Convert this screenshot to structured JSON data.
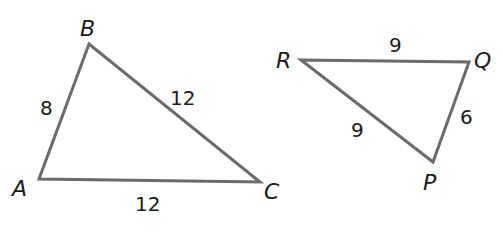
{
  "triangles": [
    {
      "name": "ABC",
      "vertices": {
        "A": {
          "label": "A",
          "x": 39,
          "y": 179,
          "lx": 12,
          "ly": 196
        },
        "B": {
          "label": "B",
          "x": 89,
          "y": 44,
          "lx": 80,
          "ly": 36
        },
        "C": {
          "label": "C",
          "x": 260,
          "y": 182,
          "lx": 264,
          "ly": 199
        }
      },
      "sides": {
        "AB": {
          "label": "8",
          "lx": 40,
          "ly": 115
        },
        "BC": {
          "label": "12",
          "lx": 170,
          "ly": 105
        },
        "AC": {
          "label": "12",
          "lx": 135,
          "ly": 211
        }
      }
    },
    {
      "name": "RQP",
      "vertices": {
        "R": {
          "label": "R",
          "x": 301,
          "y": 60,
          "lx": 276,
          "ly": 68
        },
        "Q": {
          "label": "Q",
          "x": 469,
          "y": 62,
          "lx": 474,
          "ly": 68
        },
        "P": {
          "label": "P",
          "x": 433,
          "y": 162,
          "lx": 423,
          "ly": 190
        }
      },
      "sides": {
        "RQ": {
          "label": "9",
          "lx": 389,
          "ly": 52
        },
        "RP": {
          "label": "9",
          "lx": 351,
          "ly": 137
        },
        "QP": {
          "label": "6",
          "lx": 460,
          "ly": 124
        }
      }
    }
  ],
  "colors": {
    "edge": "#6b6b6b",
    "text": "#1a1a1a",
    "background": "#ffffff"
  }
}
